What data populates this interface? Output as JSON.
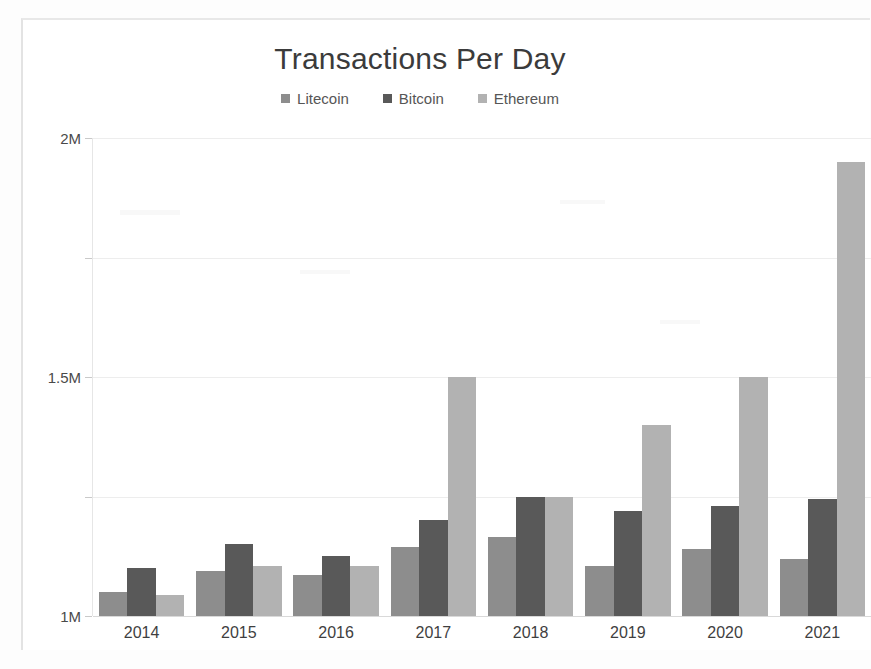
{
  "frame": {
    "background_color": "#ffffff",
    "page_background_color": "#fdfdfd"
  },
  "chart_data": {
    "type": "bar",
    "title": "Transactions Per Day",
    "subtitle": "",
    "xlabel": "",
    "ylabel": "",
    "categories": [
      "2014",
      "2015",
      "2016",
      "2017",
      "2018",
      "2019",
      "2020",
      "2021"
    ],
    "series": [
      {
        "name": "Litecoin",
        "color": "#8d8d8d",
        "values": [
          100000,
          190000,
          170000,
          290000,
          330000,
          210000,
          280000,
          240000
        ]
      },
      {
        "name": "Bitcoin",
        "color": "#595959",
        "values": [
          200000,
          300000,
          250000,
          400000,
          500000,
          440000,
          460000,
          490000
        ]
      },
      {
        "name": "Ethereum",
        "color": "#b2b2b2",
        "values": [
          90000,
          210000,
          210000,
          1000000,
          500000,
          800000,
          1000000,
          1900000
        ]
      }
    ],
    "ylim": [
      0,
      2000000
    ],
    "y_ticks": [
      0,
      500000,
      1000000,
      1500000,
      2000000
    ],
    "y_tick_labels": [
      "0M",
      "0.5M",
      "1M",
      "1.5M",
      "2M"
    ],
    "grid": true,
    "legend_position": "top-center",
    "value_unit": "M",
    "value_divisor": 1000000
  }
}
